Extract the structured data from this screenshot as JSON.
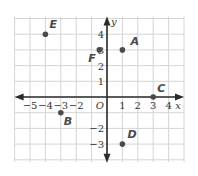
{
  "chart_data": {
    "type": "scatter",
    "title": "",
    "xlabel": "x",
    "ylabel": "y",
    "origin_label": "O",
    "xlim": [
      -6,
      5
    ],
    "ylim": [
      -4,
      5
    ],
    "grid": true,
    "x_ticks": [
      -5,
      -4,
      -3,
      -2,
      1,
      2,
      3,
      4
    ],
    "x_tick_labels": [
      "−5",
      "−4",
      "−3",
      "−2",
      "1",
      "2",
      "3",
      "4"
    ],
    "y_ticks": [
      4,
      3,
      2,
      1,
      -2,
      -3
    ],
    "y_tick_labels": [
      "4",
      "3",
      "2",
      "1",
      "−2",
      "−3"
    ],
    "points": [
      {
        "label": "A",
        "x": 1,
        "y": 3,
        "lx": 8,
        "ly": -5
      },
      {
        "label": "B",
        "x": -3,
        "y": -1,
        "lx": 3,
        "ly": 12
      },
      {
        "label": "C",
        "x": 3,
        "y": 0,
        "lx": 4,
        "ly": -5
      },
      {
        "label": "D",
        "x": 1,
        "y": -3,
        "lx": 5,
        "ly": -6
      },
      {
        "label": "E",
        "x": -4,
        "y": 4,
        "lx": 4,
        "ly": -6
      },
      {
        "label": "F",
        "x": -0.5,
        "y": 3,
        "lx": -11,
        "ly": 12
      }
    ]
  },
  "style": {
    "grid_color": "#d4d4d4",
    "axis_color": "#2b2b2b",
    "point_color": "#4a4a4a"
  }
}
